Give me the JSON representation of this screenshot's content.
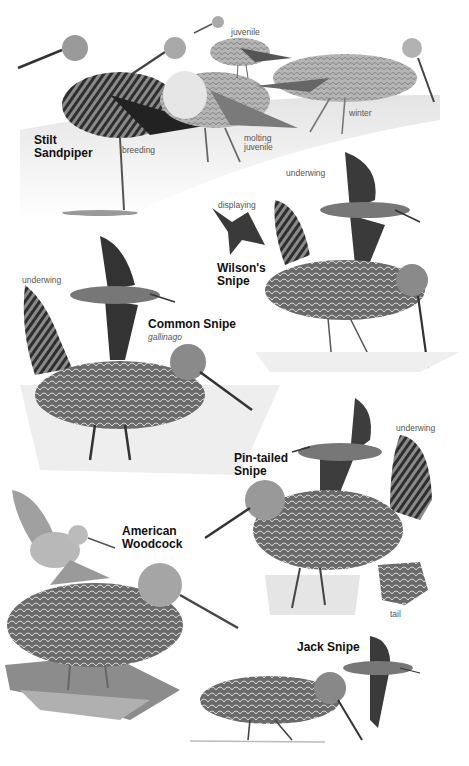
{
  "plate": {
    "species": [
      {
        "name_line1": "Stilt",
        "name_line2": "Sandpiper",
        "labels": {
          "juvenile": "juvenile",
          "breeding": "breeding",
          "molting_juvenile_1": "molting",
          "molting_juvenile_2": "juvenile",
          "winter": "winter"
        }
      },
      {
        "name_line1": "Wilson's",
        "name_line2": "Snipe",
        "labels": {
          "displaying": "displaying",
          "underwing": "underwing"
        }
      },
      {
        "name_line1": "Common Snipe",
        "subspecies": "gallinago",
        "labels": {
          "underwing": "underwing"
        }
      },
      {
        "name_line1": "Pin-tailed",
        "name_line2": "Snipe",
        "labels": {
          "underwing": "underwing",
          "tail": "tail"
        }
      },
      {
        "name_line1": "American",
        "name_line2": "Woodcock"
      },
      {
        "name_line1": "Jack Snipe"
      }
    ]
  }
}
